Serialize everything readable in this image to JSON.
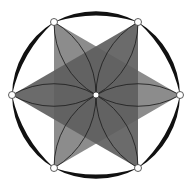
{
  "diagram": {
    "center": [
      96,
      95
    ],
    "vertex_radius": 84,
    "outer_radius": 87,
    "vertices": [
      {
        "name": "right",
        "x": 180,
        "y": 95
      },
      {
        "name": "top-right",
        "x": 138,
        "y": 22
      },
      {
        "name": "top-left",
        "x": 54,
        "y": 22
      },
      {
        "name": "left",
        "x": 12,
        "y": 95
      },
      {
        "name": "bottom-left",
        "x": 54,
        "y": 168
      },
      {
        "name": "bottom-right",
        "x": 138,
        "y": 168
      }
    ],
    "colors": {
      "background": "#ffffff",
      "crescent": "#111111",
      "light_triangle": "#8c8c8c",
      "dark_triangle": "#5e5e5e",
      "petal_stroke": "#222222",
      "node_fill": "#ffffff",
      "node_stroke": "#333333"
    },
    "triangles": [
      {
        "name": "light-triangle",
        "points": "54,22 180,95 54,168"
      },
      {
        "name": "dark-triangle",
        "points": "138,22 12,95 138,168"
      }
    ]
  }
}
